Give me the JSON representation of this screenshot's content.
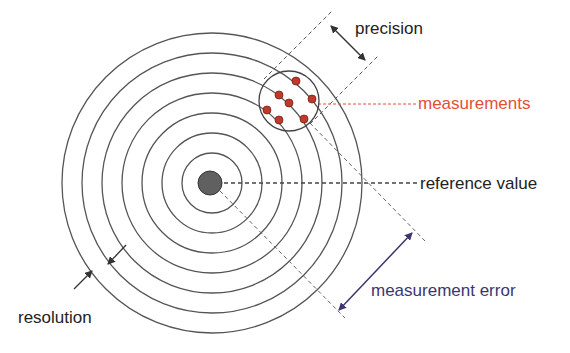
{
  "diagram": {
    "center": {
      "x": 212,
      "y": 183
    },
    "ring_radii": [
      30,
      50,
      70,
      90,
      110,
      130,
      150
    ],
    "reference_dot_radius": 12,
    "measurement_circle": {
      "cx": 289,
      "cy": 101,
      "r": 30
    },
    "measurement_points": [
      {
        "x": 296,
        "y": 81
      },
      {
        "x": 279,
        "y": 95
      },
      {
        "x": 312,
        "y": 99
      },
      {
        "x": 289,
        "y": 103
      },
      {
        "x": 267,
        "y": 110
      },
      {
        "x": 279,
        "y": 120
      },
      {
        "x": 304,
        "y": 119
      }
    ],
    "colors": {
      "ring": "#555555",
      "reference_dot": "#606060",
      "measurement_point": "#c0392b",
      "measurement_label": "#e0503a",
      "measurement_error_label": "#3b3670",
      "text": "#222222"
    }
  },
  "labels": {
    "precision": "precision",
    "measurements": "measurements",
    "reference_value": "reference value",
    "measurement_error": "measurement error",
    "resolution": "resolution"
  }
}
